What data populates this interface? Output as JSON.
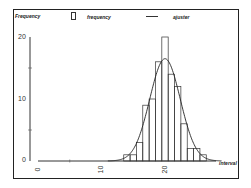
{
  "chart_data": {
    "type": "bar",
    "title": "",
    "xlabel": "interval",
    "ylabel": "Frequency",
    "legend": [
      {
        "label": "frequency",
        "kind": "box"
      },
      {
        "label": "ajuster",
        "kind": "line"
      }
    ],
    "legend_position": "top",
    "grid": false,
    "xlim": [
      0,
      30
    ],
    "ylim": [
      0,
      20
    ],
    "x_ticks": [
      0,
      10,
      20
    ],
    "y_ticks": [
      0,
      10,
      20
    ],
    "categories": [
      14,
      15,
      16,
      17,
      18,
      19,
      20,
      21,
      22,
      23,
      24,
      25,
      26
    ],
    "series": [
      {
        "name": "frequency",
        "type": "bar",
        "values": [
          1,
          1,
          3,
          9,
          10,
          16,
          20,
          14,
          12,
          6,
          2,
          2,
          1
        ]
      },
      {
        "name": "ajuster",
        "type": "line",
        "distribution": "normal",
        "mean": 20,
        "sd": 2.4,
        "peak": 16.5
      }
    ]
  },
  "labels": {
    "ylabel": "Frequency",
    "xlabel": "interval",
    "legend_bar": "frequency",
    "legend_line": "ajuster",
    "y0": "0",
    "y10": "10",
    "y20": "20",
    "x0": "0",
    "x10": "10",
    "x20": "20"
  }
}
